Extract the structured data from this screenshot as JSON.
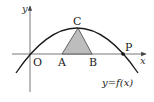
{
  "diagram": {
    "type": "function-graph",
    "axes": {
      "x_label": "x",
      "y_label": "y",
      "origin_label": "O"
    },
    "curve_label": "y=f(x)",
    "points": {
      "O": "O",
      "A": "A",
      "B": "B",
      "C": "C",
      "P": "P"
    },
    "colors": {
      "curve": "#1a1a1a",
      "axis": "#555555",
      "triangle_fill": "#bdbdbd",
      "triangle_stroke": "#444444"
    }
  }
}
